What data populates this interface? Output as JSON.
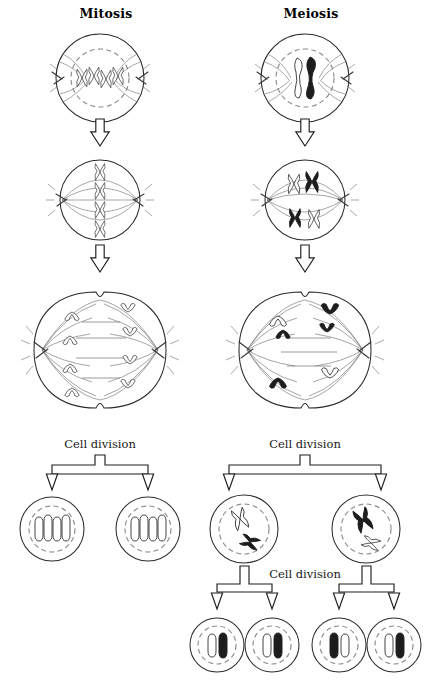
{
  "figure": {
    "background_color": "#ffffff",
    "ink_color": "#1f1f1f",
    "chromosome_dark_color": "#1d1d1d",
    "chromosome_light_color": "#ffffff",
    "nuclear_envelope_color": "#8d8d8d",
    "spindle_color": "#6f6f6f"
  },
  "columns": {
    "left": {
      "title": "Mitosis"
    },
    "right": {
      "title": "Meiosis"
    }
  },
  "labels": {
    "cell_division_mitosis": "Cell division",
    "cell_division_meiosis_one": "Cell division",
    "cell_division_meiosis_two": "Cell division"
  },
  "mitosis": {
    "stage_1": {
      "chromosome_count": 4,
      "chromosome_shape": "X",
      "shading": [
        "light",
        "light",
        "light",
        "light"
      ],
      "nuclear_envelope": true
    },
    "stage_2": {
      "chromosome_count": 4,
      "chromosome_shape": "X",
      "alignment": "equatorial-plate",
      "shading": [
        "light",
        "light",
        "light",
        "light"
      ],
      "nuclear_envelope": false
    },
    "stage_3": {
      "chromatids_per_pole": 4,
      "chromosome_shape": "V",
      "shading": [
        "light",
        "light",
        "light",
        "light"
      ],
      "cleavage_furrow": true
    },
    "daughter_cells": [
      {
        "chromosome_count": 4,
        "chromosome_shape": "rod",
        "shading": [
          "light",
          "light",
          "light",
          "light"
        ]
      },
      {
        "chromosome_count": 4,
        "chromosome_shape": "rod",
        "shading": [
          "light",
          "light",
          "light",
          "light"
        ]
      }
    ]
  },
  "meiosis": {
    "stage_1": {
      "chromosome_count": 2,
      "chromosome_shape": "paired-bivalent",
      "shading": [
        "light",
        "dark"
      ],
      "nuclear_envelope": true
    },
    "stage_2": {
      "chromosome_count": 4,
      "chromosome_shape": "X",
      "alignment": "paired-homologues",
      "shading": [
        "light",
        "dark",
        "dark",
        "light"
      ],
      "nuclear_envelope": false
    },
    "stage_3": {
      "chromatids_per_pole": 2,
      "chromosome_shape": "V",
      "shading": [
        "light",
        "dark",
        "dark",
        "light"
      ],
      "cleavage_furrow": true
    },
    "daughter_cells": [
      {
        "chromosome_count": 2,
        "chromosome_shape": "X",
        "shading": [
          "light",
          "dark"
        ]
      },
      {
        "chromosome_count": 2,
        "chromosome_shape": "X",
        "shading": [
          "dark",
          "light"
        ]
      }
    ],
    "gametes": [
      {
        "chromosome_count": 2,
        "shading": [
          "light",
          "dark"
        ]
      },
      {
        "chromosome_count": 2,
        "shading": [
          "light",
          "dark"
        ]
      },
      {
        "chromosome_count": 2,
        "shading": [
          "dark",
          "light"
        ]
      },
      {
        "chromosome_count": 2,
        "shading": [
          "light",
          "dark"
        ]
      }
    ]
  }
}
